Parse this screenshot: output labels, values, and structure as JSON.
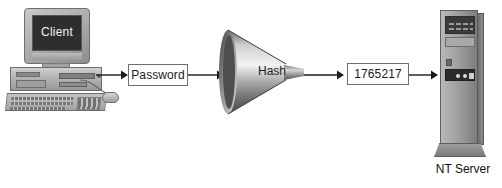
{
  "diagram": {
    "type": "flow-diagram",
    "background_color": "#ffffff",
    "nodes": {
      "client": {
        "label": "Client",
        "screen_label": "Client",
        "kind": "desktop-computer"
      },
      "password": {
        "label": "Password",
        "kind": "labeled-box"
      },
      "hash": {
        "label": "Hash",
        "kind": "funnel"
      },
      "hash_value": {
        "label": "1765217",
        "kind": "labeled-box"
      },
      "server": {
        "label": "NT Server",
        "kind": "tower-server"
      }
    },
    "edges": [
      {
        "from": "client",
        "to": "password",
        "style": "arrow"
      },
      {
        "from": "password",
        "to": "hash",
        "style": "arrow"
      },
      {
        "from": "hash",
        "to": "hash_value",
        "style": "arrow"
      },
      {
        "from": "hash_value",
        "to": "server",
        "style": "arrow"
      }
    ],
    "colors": {
      "stroke": "#1a1a1a",
      "box_fill": "#ffffff",
      "box_border": "#6e6e6e",
      "screen_fill": "#2e2e2e",
      "screen_text": "#f2f2f2",
      "metal_light": "#cfcfcf",
      "metal_dark": "#6f6f6f"
    }
  }
}
